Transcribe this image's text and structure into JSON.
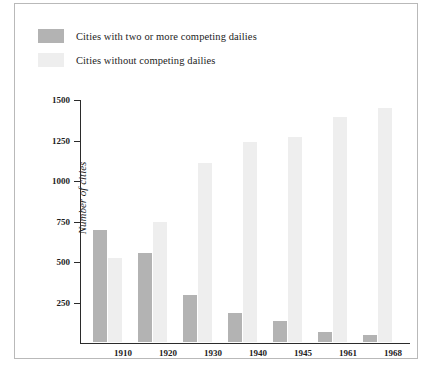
{
  "figure": {
    "background_color": "#ffffff",
    "frame_color": "#b9b9b9"
  },
  "legend": {
    "position": "top-left",
    "entries": [
      {
        "label": "Cities with two or more competing dailies",
        "color": "#b3b3b3",
        "swatch_name": "legend-swatch-competing"
      },
      {
        "label": "Cities without competing dailies",
        "color": "#eeeeee",
        "swatch_name": "legend-swatch-noncompeting"
      }
    ]
  },
  "chart_data": {
    "type": "bar",
    "title": "",
    "xlabel": "",
    "ylabel": "Number of cities",
    "categories": [
      "1910",
      "1920",
      "1930",
      "1940",
      "1945",
      "1961",
      "1968"
    ],
    "series": [
      {
        "name": "Cities with two or more competing dailies",
        "color": "#b3b3b3",
        "values": [
          689,
          552,
          288,
          181,
          127,
          61,
          45
        ]
      },
      {
        "name": "Cities without competing dailies",
        "color": "#eeeeee",
        "values": [
          518,
          738,
          1103,
          1235,
          1266,
          1391,
          1444
        ]
      }
    ],
    "ylim": [
      0,
      1500
    ],
    "yticks": [
      250,
      500,
      750,
      1000,
      1250,
      1500
    ],
    "ytick_labels": [
      "250",
      "500",
      "750",
      "1000",
      "1250",
      "1500"
    ],
    "grid": false,
    "legend_position": "top-left",
    "bar_group_order": [
      "Cities with two or more competing dailies",
      "Cities without competing dailies"
    ]
  }
}
